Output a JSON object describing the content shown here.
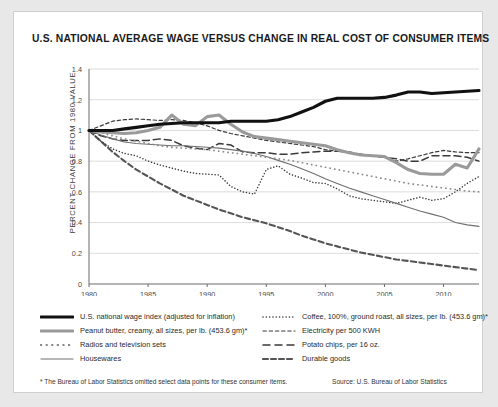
{
  "title": "U.S. NATIONAL AVERAGE WAGE VERSUS CHANGE IN REAL COST OF CONSUMER ITEMS",
  "footnote": "* The Bureau of Labor Statistics omitted select data points for these consumer items.",
  "source": "Source: U.S. Bureau of Labor Statistics",
  "legend": {
    "left": [
      {
        "label": "U.S. national wage index (adjusted for inflation)",
        "style": "thick-solid-black",
        "color": "#111111"
      },
      {
        "label": "Peanut butter, creamy, all sizes, per lb. (453.6 gm)*",
        "style": "thick-solid-gray",
        "color": "#9a9a9a"
      },
      {
        "label": "Radios and television sets",
        "style": "square-dots",
        "color": "#8a8a8a"
      },
      {
        "label": "Housewares",
        "style": "thin-solid-gray",
        "color": "#6f6f6f"
      }
    ],
    "right": [
      {
        "label": "Coffee, 100%, ground roast, all sizes, per lb. (453.6 gm)*",
        "style": "fine-dotted",
        "color": "#3a3a3a"
      },
      {
        "label": "Electricity per 500 KWH",
        "style": "short-dash",
        "color": "#3a3a3a"
      },
      {
        "label": "Potato chips, per 16 oz.",
        "style": "long-dash",
        "color": "#3a3a3a"
      },
      {
        "label": "Durable goods",
        "style": "thick-dash",
        "color": "#555555"
      }
    ]
  },
  "chart_data": {
    "type": "line",
    "title": "U.S. NATIONAL AVERAGE WAGE VERSUS CHANGE IN REAL COST OF CONSUMER ITEMS",
    "xlabel": "",
    "ylabel": "PERCENT CHANGE FROM 1980 VALUE",
    "xlim": [
      1980,
      2013
    ],
    "ylim": [
      0,
      1.4
    ],
    "ytick_values": [
      0,
      0.2,
      0.4,
      0.6,
      0.8,
      1.0,
      1.2,
      1.4
    ],
    "ytick_labels": [
      "0",
      "0.2",
      "0.4",
      "0.6",
      "0.8",
      "1",
      "1.2",
      "1.4"
    ],
    "xtick_values": [
      1980,
      1985,
      1990,
      1995,
      2000,
      2005,
      2010
    ],
    "xtick_labels": [
      "1980",
      "1985",
      "1990",
      "1995",
      "2000",
      "2005",
      "2010"
    ],
    "grid": "horizontal",
    "legend_position": "below",
    "x": [
      1980,
      1981,
      1982,
      1983,
      1984,
      1985,
      1986,
      1987,
      1988,
      1989,
      1990,
      1991,
      1992,
      1993,
      1994,
      1995,
      1996,
      1997,
      1998,
      1999,
      2000,
      2001,
      2002,
      2003,
      2004,
      2005,
      2006,
      2007,
      2008,
      2009,
      2010,
      2011,
      2012,
      2013
    ],
    "series": [
      {
        "name": "U.S. national wage index (adjusted for inflation)",
        "style": "thick-solid-black",
        "color": "#111111",
        "width": 3.1,
        "values": [
          1.0,
          1.0,
          1.0,
          1.01,
          1.02,
          1.03,
          1.04,
          1.045,
          1.05,
          1.05,
          1.05,
          1.05,
          1.06,
          1.06,
          1.06,
          1.06,
          1.07,
          1.09,
          1.12,
          1.15,
          1.19,
          1.21,
          1.21,
          1.21,
          1.21,
          1.215,
          1.23,
          1.25,
          1.25,
          1.24,
          1.245,
          1.25,
          1.255,
          1.26
        ]
      },
      {
        "name": "Peanut butter, creamy, all sizes, per lb. (453.6 gm)*",
        "style": "thick-solid-gray",
        "color": "#9a9a9a",
        "width": 3.1,
        "values": [
          1.0,
          0.99,
          0.985,
          0.98,
          0.985,
          1.0,
          1.02,
          1.1,
          1.04,
          1.03,
          1.09,
          1.1,
          1.04,
          0.99,
          0.96,
          0.95,
          0.94,
          0.93,
          0.92,
          0.91,
          0.9,
          0.875,
          0.855,
          0.84,
          0.835,
          0.83,
          0.79,
          0.745,
          0.72,
          0.715,
          0.715,
          0.78,
          0.755,
          0.88
        ]
      },
      {
        "name": "Radios and television sets",
        "style": "square-dots",
        "color": "#8a8a8a",
        "width": 1.6,
        "values": [
          1.0,
          0.985,
          0.965,
          0.945,
          0.93,
          0.915,
          0.9,
          0.89,
          0.885,
          0.88,
          0.875,
          0.865,
          0.855,
          0.845,
          0.835,
          0.825,
          0.815,
          0.805,
          0.79,
          0.775,
          0.76,
          0.745,
          0.73,
          0.715,
          0.7,
          0.685,
          0.67,
          0.655,
          0.645,
          0.635,
          0.625,
          0.615,
          0.605,
          0.6
        ]
      },
      {
        "name": "Housewares",
        "style": "thin-solid-gray",
        "color": "#6f6f6f",
        "width": 1.1,
        "values": [
          1.0,
          0.97,
          0.945,
          0.925,
          0.915,
          0.91,
          0.905,
          0.9,
          0.9,
          0.895,
          0.89,
          0.885,
          0.875,
          0.865,
          0.85,
          0.83,
          0.805,
          0.78,
          0.75,
          0.72,
          0.685,
          0.655,
          0.625,
          0.6,
          0.575,
          0.55,
          0.525,
          0.5,
          0.475,
          0.455,
          0.435,
          0.4,
          0.385,
          0.375
        ]
      },
      {
        "name": "Coffee, 100%, ground roast, all sizes, per lb. (453.6 gm)*",
        "style": "fine-dotted",
        "color": "#3a3a3a",
        "width": 1.5,
        "values": [
          1.0,
          0.93,
          0.88,
          0.85,
          0.835,
          0.8,
          0.775,
          0.755,
          0.735,
          0.72,
          0.715,
          0.71,
          0.635,
          0.6,
          0.585,
          0.745,
          0.77,
          0.715,
          0.69,
          0.66,
          0.655,
          0.62,
          0.575,
          0.555,
          0.545,
          0.535,
          0.525,
          0.545,
          0.565,
          0.545,
          0.555,
          0.6,
          0.655,
          0.7
        ]
      },
      {
        "name": "Electricity per 500 KWH",
        "style": "short-dash",
        "color": "#3a3a3a",
        "width": 1.2,
        "values": [
          1.0,
          1.03,
          1.06,
          1.07,
          1.075,
          1.07,
          1.065,
          1.07,
          1.065,
          1.05,
          1.03,
          1.0,
          0.98,
          0.965,
          0.95,
          0.935,
          0.925,
          0.915,
          0.905,
          0.895,
          0.875,
          0.865,
          0.855,
          0.845,
          0.835,
          0.825,
          0.8,
          0.815,
          0.835,
          0.855,
          0.87,
          0.86,
          0.855,
          0.855
        ]
      },
      {
        "name": "Potato chips, per 16 oz.",
        "style": "long-dash",
        "color": "#3a3a3a",
        "width": 1.5,
        "values": [
          1.0,
          0.965,
          0.945,
          0.935,
          0.935,
          0.935,
          0.945,
          0.935,
          0.9,
          0.885,
          0.875,
          0.915,
          0.905,
          0.86,
          0.855,
          0.855,
          0.845,
          0.845,
          0.855,
          0.86,
          0.865,
          0.865,
          0.86,
          0.845,
          0.835,
          0.825,
          0.815,
          0.8,
          0.8,
          0.835,
          0.835,
          0.835,
          0.825,
          0.8
        ]
      },
      {
        "name": "Durable goods",
        "style": "thick-dash",
        "color": "#555555",
        "width": 2.1,
        "values": [
          1.0,
          0.93,
          0.86,
          0.8,
          0.745,
          0.7,
          0.655,
          0.615,
          0.575,
          0.545,
          0.515,
          0.485,
          0.46,
          0.435,
          0.415,
          0.395,
          0.37,
          0.345,
          0.315,
          0.29,
          0.265,
          0.245,
          0.225,
          0.205,
          0.19,
          0.175,
          0.16,
          0.15,
          0.14,
          0.13,
          0.12,
          0.11,
          0.1,
          0.09
        ]
      }
    ]
  }
}
